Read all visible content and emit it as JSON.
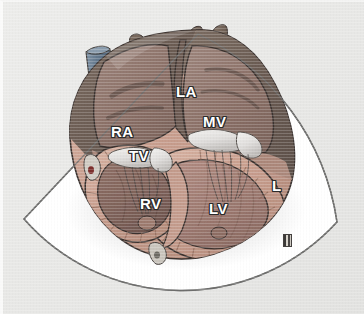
{
  "figure": {
    "background_color": "#e8e8e6"
  },
  "sector": {
    "name": "ultrasound-sector-fan",
    "fill_color": "#ffffff",
    "outline_color": "#6f6f6d",
    "apex": {
      "x": 24,
      "y": 219
    },
    "near_left": {
      "x": 104,
      "y": 128
    },
    "far_left": {
      "x": 198,
      "y": 34
    },
    "far_right": {
      "x": 337,
      "y": 222
    }
  },
  "anatomy": {
    "atrium_wall_color": "#6f6157",
    "atrium_chamber_color": "#8a7168",
    "ventricle_wall_color": "#c8a293",
    "ventricle_chamber_color": "#a78178",
    "valve_color": "#e4e2e0",
    "vessel_color": "#5e7186",
    "outline_color": "#3b3330",
    "vessels": [
      {
        "name": "superior-vena-cava",
        "color": "#5e7186"
      },
      {
        "name": "pulmonary-vein-stump-left",
        "color": "#7a6a5e"
      },
      {
        "name": "pulmonary-vein-stump-right",
        "color": "#7a6a5e"
      }
    ],
    "coronary_marks": [
      {
        "name": "coronary-vessel-left",
        "color": "#7c2f2c"
      },
      {
        "name": "coronary-vessel-bottom",
        "color": "#6d6a63"
      }
    ]
  },
  "labels": [
    {
      "id": "la",
      "text": "LA",
      "name": "label-left-atrium",
      "x": 176,
      "y": 84,
      "size": "lg"
    },
    {
      "id": "mv",
      "text": "MV",
      "name": "label-mitral-valve",
      "x": 203,
      "y": 114,
      "size": "lg"
    },
    {
      "id": "ra",
      "text": "RA",
      "name": "label-right-atrium",
      "x": 111,
      "y": 124,
      "size": "lg"
    },
    {
      "id": "tv",
      "text": "TV",
      "name": "label-tricuspid-valve",
      "x": 129,
      "y": 148,
      "size": "lg"
    },
    {
      "id": "rv",
      "text": "RV",
      "name": "label-right-ventricle",
      "x": 140,
      "y": 196,
      "size": "lg"
    },
    {
      "id": "lv",
      "text": "LV",
      "name": "label-left-ventricle",
      "x": 209,
      "y": 201,
      "size": "lg"
    },
    {
      "id": "l",
      "text": "L",
      "name": "label-lateral-wall",
      "x": 272,
      "y": 178,
      "size": "lg"
    }
  ],
  "artist_stamp": {
    "name": "artist-signature-stamp",
    "x": 283,
    "y": 234,
    "color": "#44413f"
  }
}
